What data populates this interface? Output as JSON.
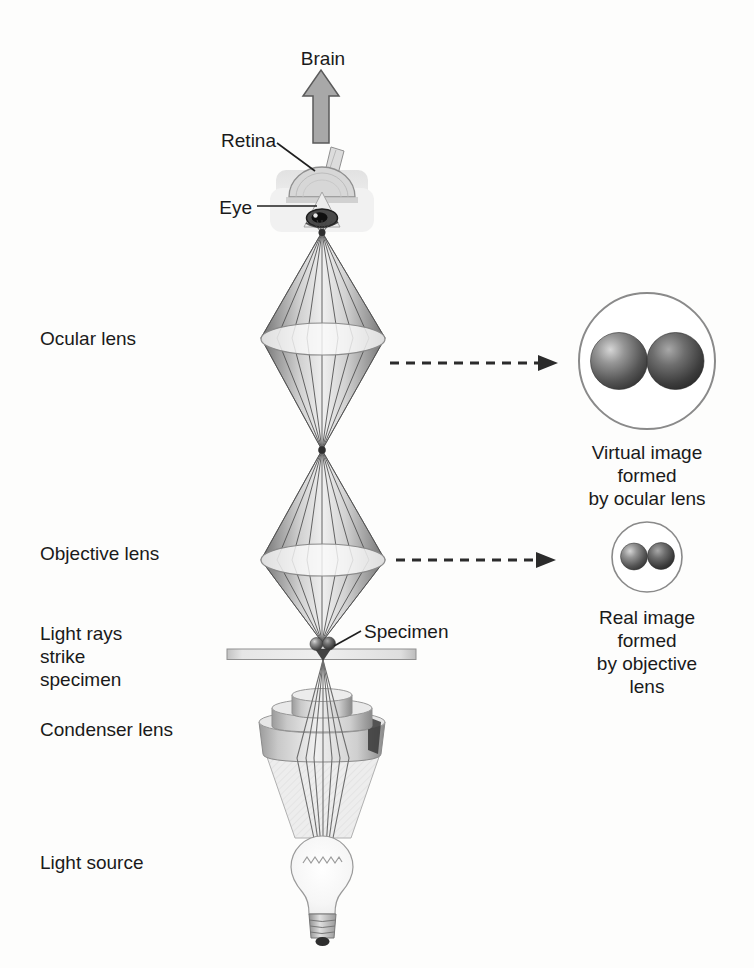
{
  "colors": {
    "ink": "#1a1a1a",
    "arrow_fill": "#a8a8a8",
    "arrow_stroke": "#5a5a5a",
    "dashed_arrow": "#2b2b2b"
  },
  "labels": {
    "brain": "Brain",
    "retina": "Retina",
    "eye": "Eye",
    "ocular_lens": "Ocular lens",
    "objective_lens": "Objective lens",
    "light_rays_strike_specimen": "Light rays\nstrike\nspecimen",
    "condenser_lens": "Condenser lens",
    "light_source": "Light source",
    "specimen": "Specimen"
  },
  "captions": {
    "virtual_image": "Virtual image\nformed\nby ocular lens",
    "real_image": "Real image\nformed\nby objective\nlens"
  }
}
